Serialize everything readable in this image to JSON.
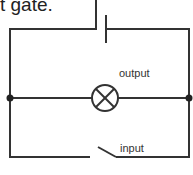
{
  "caption": "t gate.",
  "labels": {
    "output": "output",
    "input": "input"
  },
  "colors": {
    "wire": "#333333",
    "background": "#ffffff"
  },
  "components": [
    "battery",
    "lamp",
    "switch",
    "junction-left",
    "junction-right"
  ]
}
